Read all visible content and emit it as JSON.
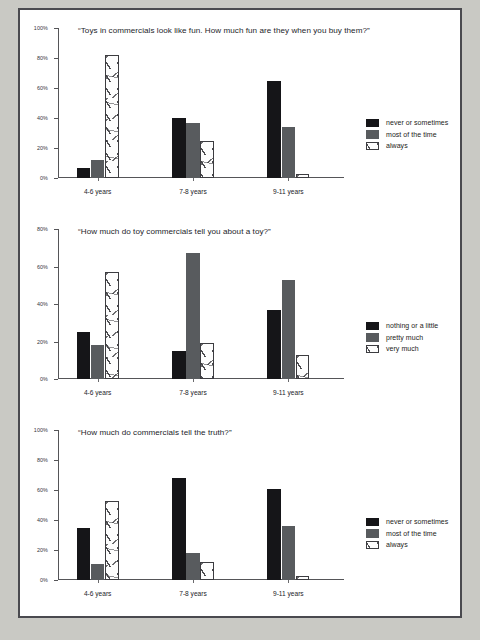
{
  "page": {
    "background_color": "#c9c9c4",
    "sheet_color": "#ffffff",
    "frame_color": "#4a4a4f"
  },
  "palette": {
    "series_dark": "#151518",
    "series_gray": "#585b5e",
    "series_hatched": "#fdfdfd",
    "axis": "#555558",
    "text": "#24242a"
  },
  "chart_data": [
    {
      "type": "bar",
      "title": "“Toys in commercials look like fun. How much fun are they when you buy them?”",
      "xlabel": "",
      "ylabel": "",
      "ylim": [
        0,
        100
      ],
      "yticks": [
        "0%",
        "20%",
        "40%",
        "60%",
        "80%",
        "100%"
      ],
      "ytick_values": [
        0,
        20,
        40,
        60,
        80,
        100
      ],
      "grid": false,
      "legend_position": "right",
      "categories": [
        "4-6 years",
        "7-8 years",
        "9-11 years"
      ],
      "series": [
        {
          "name": "never or sometimes",
          "values": [
            7,
            40,
            65
          ]
        },
        {
          "name": "most of the time",
          "values": [
            12,
            37,
            34
          ]
        },
        {
          "name": "always",
          "values": [
            82,
            25,
            3
          ]
        }
      ]
    },
    {
      "type": "bar",
      "title": "“How much do toy commercials tell you about a toy?”",
      "xlabel": "",
      "ylabel": "",
      "ylim": [
        0,
        80
      ],
      "yticks": [
        "0%",
        "20%",
        "40%",
        "60%",
        "80%"
      ],
      "ytick_values": [
        0,
        20,
        40,
        60,
        80
      ],
      "grid": false,
      "legend_position": "right",
      "categories": [
        "4-6 years",
        "7-8 years",
        "9-11 years"
      ],
      "series": [
        {
          "name": "nothing or a little",
          "values": [
            25,
            15,
            37
          ]
        },
        {
          "name": "pretty much",
          "values": [
            18,
            67,
            53
          ]
        },
        {
          "name": "very much",
          "values": [
            57,
            19,
            13
          ]
        }
      ]
    },
    {
      "type": "bar",
      "title": "“How much do commercials tell the truth?”",
      "xlabel": "",
      "ylabel": "",
      "ylim": [
        0,
        100
      ],
      "yticks": [
        "0%",
        "20%",
        "40%",
        "60%",
        "80%",
        "100%"
      ],
      "ytick_values": [
        0,
        20,
        40,
        60,
        80,
        100
      ],
      "grid": false,
      "legend_position": "right",
      "categories": [
        "4-6 years",
        "7-8 years",
        "9-11 years"
      ],
      "series": [
        {
          "name": "never or sometimes",
          "values": [
            35,
            68,
            61
          ]
        },
        {
          "name": "most of the time",
          "values": [
            11,
            18,
            36
          ]
        },
        {
          "name": "always",
          "values": [
            53,
            12,
            3
          ]
        }
      ]
    }
  ]
}
